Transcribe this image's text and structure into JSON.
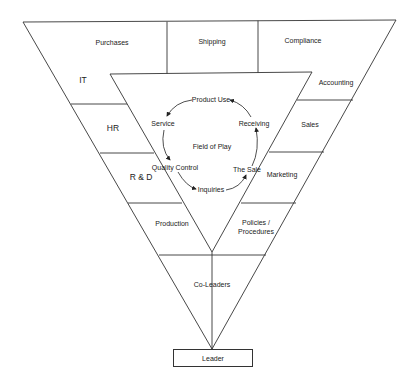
{
  "diagram": {
    "type": "inverted-pyramid-organization",
    "top_band": [
      "Purchases",
      "Shipping",
      "Compliance"
    ],
    "left_column": [
      "IT",
      "HR",
      "R & D",
      "Production"
    ],
    "right_column": [
      "Accounting",
      "Sales",
      "Marketing",
      "Policies / Procedures"
    ],
    "center": {
      "title": "Field of Play",
      "cycle": [
        "Product Use",
        "Service",
        "Quality Control",
        "Inquiries",
        "The Sale",
        "Receiving"
      ]
    },
    "lower": "Co-Leaders",
    "base": "Leader"
  },
  "labels": {
    "purchases": "Purchases",
    "shipping": "Shipping",
    "compliance": "Compliance",
    "it": "IT",
    "hr": "HR",
    "rd": "R & D",
    "production": "Production",
    "accounting": "Accounting",
    "sales": "Sales",
    "marketing": "Marketing",
    "policies_line1": "Policies /",
    "policies_line2": "Procedures",
    "field_of_play": "Field of Play",
    "product_use": "Product Use",
    "service": "Service",
    "quality_control": "Quality Control",
    "inquiries": "Inquiries",
    "the_sale": "The Sale",
    "receiving": "Receiving",
    "co_leaders": "Co-Leaders",
    "leader": "Leader"
  },
  "colors": {
    "line": "#333333",
    "background": "#ffffff"
  }
}
